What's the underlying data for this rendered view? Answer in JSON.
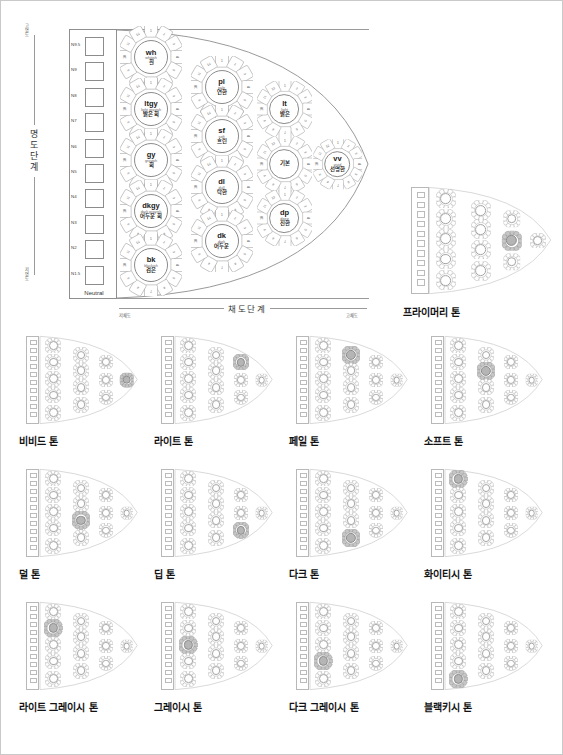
{
  "diagram": {
    "title_present": false,
    "axes": {
      "vertical_label": "명도단계",
      "vertical_high": "고명도",
      "vertical_low": "저명도",
      "horizontal_label": "채도단계",
      "horizontal_low": "저채도",
      "horizontal_high": "고채도"
    },
    "neutral": {
      "caption": "Neutral",
      "steps": [
        "N9.5",
        "N9",
        "N8",
        "N7",
        "N6",
        "N5",
        "N4",
        "N3",
        "N2",
        "N1.5"
      ]
    },
    "columns": [
      {
        "name": "column-1",
        "tones": [
          {
            "abbr": "wh",
            "eng": "whitish",
            "kor": "흰",
            "petals": 12
          },
          {
            "abbr": "ltgy",
            "eng": "light grayish",
            "kor": "밝은 회",
            "petals": 12
          },
          {
            "abbr": "gy",
            "eng": "grayish",
            "kor": "회",
            "petals": 12
          },
          {
            "abbr": "dkgy",
            "eng": "dark grayish",
            "kor": "어두운 회",
            "petals": 12
          },
          {
            "abbr": "bk",
            "eng": "blackish",
            "kor": "검은",
            "petals": 12
          }
        ]
      },
      {
        "name": "column-2",
        "tones": [
          {
            "abbr": "pl",
            "eng": "pale",
            "kor": "연한",
            "petals": 12
          },
          {
            "abbr": "sf",
            "eng": "soft",
            "kor": "흐린",
            "petals": 12
          },
          {
            "abbr": "dl",
            "eng": "dull",
            "kor": "탁한",
            "petals": 12
          },
          {
            "abbr": "dk",
            "eng": "dark",
            "kor": "어두운",
            "petals": 12
          }
        ]
      },
      {
        "name": "column-3",
        "tones": [
          {
            "abbr": "lt",
            "eng": "light",
            "kor": "밝은",
            "petals": 12
          },
          {
            "abbr": "",
            "eng": "",
            "kor": "기본",
            "petals": 12
          },
          {
            "abbr": "dp",
            "eng": "deep",
            "kor": "진한",
            "petals": 12
          }
        ]
      },
      {
        "name": "column-4",
        "tones": [
          {
            "abbr": "vv",
            "eng": "vivid",
            "kor": "선명한",
            "petals": 12
          }
        ]
      }
    ],
    "petal_numbers": [
      "1",
      "2",
      "3",
      "4",
      "5",
      "6",
      "7",
      "8",
      "9",
      "10",
      "11",
      "12"
    ]
  },
  "thumbnails": [
    {
      "label": "프라이머리 톤",
      "highlight": {
        "column": 3,
        "index": 1
      }
    },
    {
      "label": "비비드 톤",
      "highlight": {
        "column": 4,
        "index": 0
      }
    },
    {
      "label": "라이트 톤",
      "highlight": {
        "column": 3,
        "index": 0
      }
    },
    {
      "label": "페일 톤",
      "highlight": {
        "column": 2,
        "index": 0
      }
    },
    {
      "label": "소프트 톤",
      "highlight": {
        "column": 2,
        "index": 1
      }
    },
    {
      "label": "덜 톤",
      "highlight": {
        "column": 2,
        "index": 2
      }
    },
    {
      "label": "딥 톤",
      "highlight": {
        "column": 3,
        "index": 2
      }
    },
    {
      "label": "다크 톤",
      "highlight": {
        "column": 2,
        "index": 3
      }
    },
    {
      "label": "화이티시 톤",
      "highlight": {
        "column": 1,
        "index": 0
      }
    },
    {
      "label": "라이트 그레이시 톤",
      "highlight": {
        "column": 1,
        "index": 1
      }
    },
    {
      "label": "그레이시 톤",
      "highlight": {
        "column": 1,
        "index": 2
      }
    },
    {
      "label": "다크 그레이시 톤",
      "highlight": {
        "column": 1,
        "index": 3
      }
    },
    {
      "label": "블랙키시 톤",
      "highlight": {
        "column": 1,
        "index": 4
      }
    }
  ],
  "colors": {
    "line": "#8b8b8b",
    "frame": "#c9c9c9",
    "text": "#1a1a1a",
    "muted": "#666666",
    "highlight": "#b5b5b5",
    "background": "#ffffff"
  }
}
